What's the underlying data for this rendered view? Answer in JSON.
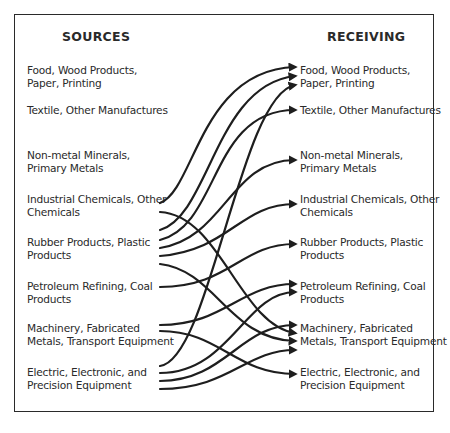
{
  "diagram": {
    "sources_heading": "SOURCES",
    "receiving_heading": "RECEIVING",
    "sectors": [
      {
        "line1": "Food, Wood Products,",
        "line2": "Paper, Printing"
      },
      {
        "line1": "Textile, Other Manufactures",
        "line2": ""
      },
      {
        "line1": "Non-metal Minerals,",
        "line2": "Primary Metals"
      },
      {
        "line1": "Industrial Chemicals, Other",
        "line2": "Chemicals"
      },
      {
        "line1": "Rubber Products, Plastic",
        "line2": "Products"
      },
      {
        "line1": "Petroleum Refining, Coal",
        "line2": "Products"
      },
      {
        "line1": "Machinery, Fabricated",
        "line2": "Metals, Transport Equipment"
      },
      {
        "line1": "Electric, Electronic, and",
        "line2": "Precision Equipment"
      }
    ],
    "flows": [
      {
        "from": "Industrial Chemicals, Other Chemicals",
        "to": "Food, Wood Products, Paper, Printing"
      },
      {
        "from": "Industrial Chemicals, Other Chemicals",
        "to": "Machinery, Fabricated Metals, Transport Equipment"
      },
      {
        "from": "Rubber Products, Plastic Products",
        "to": "Food, Wood Products, Paper, Printing"
      },
      {
        "from": "Rubber Products, Plastic Products",
        "to": "Textile, Other Manufactures"
      },
      {
        "from": "Rubber Products, Plastic Products",
        "to": "Non-metal Minerals, Primary Metals"
      },
      {
        "from": "Rubber Products, Plastic Products",
        "to": "Industrial Chemicals, Other Chemicals"
      },
      {
        "from": "Rubber Products, Plastic Products",
        "to": "Machinery, Fabricated Metals, Transport Equipment"
      },
      {
        "from": "Petroleum Refining, Coal Products",
        "to": "Rubber Products, Plastic Products"
      },
      {
        "from": "Machinery, Fabricated Metals, Transport Equipment",
        "to": "Petroleum Refining, Coal Products"
      },
      {
        "from": "Machinery, Fabricated Metals, Transport Equipment",
        "to": "Electric, Electronic, and Precision Equipment"
      },
      {
        "from": "Electric, Electronic, and Precision Equipment",
        "to": "Food, Wood Products, Paper, Printing"
      },
      {
        "from": "Electric, Electronic, and Precision Equipment",
        "to": "Petroleum Refining, Coal Products"
      },
      {
        "from": "Electric, Electronic, and Precision Equipment",
        "to": "Machinery, Fabricated Metals, Transport Equipment"
      },
      {
        "from": "Electric, Electronic, and Precision Equipment",
        "to": "Machinery, Fabricated Metals, Transport Equipment"
      }
    ]
  }
}
